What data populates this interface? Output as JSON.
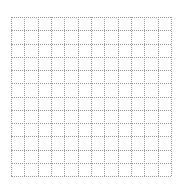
{
  "grid": {
    "rows": 12,
    "columns": 12,
    "line_style": "dotted",
    "line_color": "#9a9a9a",
    "background_color": "#ffffff"
  }
}
